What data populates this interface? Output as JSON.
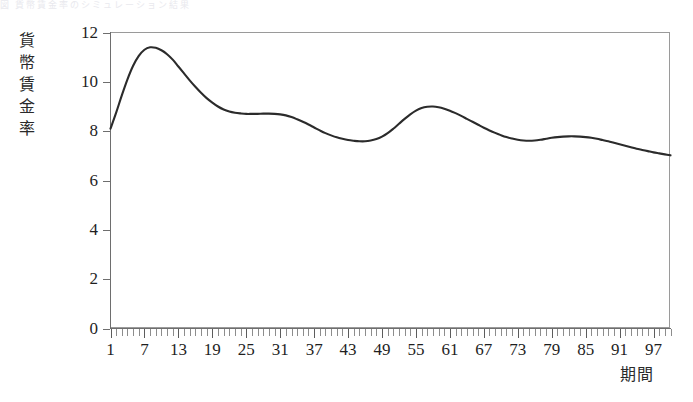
{
  "figure": {
    "top_caption_faint": "図 貨幣賃金率のシミュレーション結果"
  },
  "chart_data": {
    "type": "line",
    "title": "",
    "xlabel": "期間",
    "ylabel": "貨幣賃金率",
    "xlim": [
      1,
      100
    ],
    "ylim": [
      0,
      12
    ],
    "grid": false,
    "legend": "none",
    "y_ticks": [
      0,
      2,
      4,
      6,
      8,
      10,
      12
    ],
    "y_tick_labels": [
      "0",
      "2",
      "4",
      "6",
      "8",
      "10",
      "12"
    ],
    "x_ticks": [
      1,
      7,
      13,
      19,
      25,
      31,
      37,
      43,
      49,
      55,
      61,
      67,
      73,
      79,
      85,
      91,
      97
    ],
    "x_tick_labels": [
      "1",
      "7",
      "13",
      "19",
      "25",
      "31",
      "37",
      "43",
      "49",
      "55",
      "61",
      "67",
      "73",
      "79",
      "85",
      "91",
      "97"
    ],
    "x_minor_tick_step": 1,
    "series": [
      {
        "name": "貨幣賃金率",
        "color": "#2b2b2b",
        "x": [
          1,
          2,
          3,
          4,
          5,
          6,
          7,
          8,
          9,
          10,
          11,
          12,
          13,
          14,
          15,
          16,
          17,
          18,
          19,
          20,
          21,
          22,
          23,
          24,
          25,
          26,
          27,
          28,
          29,
          30,
          31,
          32,
          33,
          34,
          35,
          36,
          37,
          38,
          39,
          40,
          41,
          42,
          43,
          44,
          45,
          46,
          47,
          48,
          49,
          50,
          51,
          52,
          53,
          54,
          55,
          56,
          57,
          58,
          59,
          60,
          61,
          62,
          63,
          64,
          65,
          66,
          67,
          68,
          69,
          70,
          71,
          72,
          73,
          74,
          75,
          76,
          77,
          78,
          79,
          80,
          81,
          82,
          83,
          84,
          85,
          86,
          87,
          88,
          89,
          90,
          91,
          92,
          93,
          94,
          95,
          96,
          97,
          98,
          99,
          100
        ],
        "y": [
          8.1,
          8.75,
          9.45,
          10.1,
          10.65,
          11.05,
          11.3,
          11.4,
          11.38,
          11.28,
          11.12,
          10.9,
          10.62,
          10.34,
          10.06,
          9.8,
          9.56,
          9.34,
          9.16,
          9.0,
          8.88,
          8.8,
          8.75,
          8.72,
          8.7,
          8.7,
          8.7,
          8.71,
          8.71,
          8.7,
          8.68,
          8.64,
          8.57,
          8.48,
          8.38,
          8.27,
          8.15,
          8.03,
          7.92,
          7.83,
          7.75,
          7.69,
          7.64,
          7.61,
          7.59,
          7.59,
          7.62,
          7.68,
          7.78,
          7.92,
          8.1,
          8.3,
          8.5,
          8.68,
          8.83,
          8.94,
          8.99,
          9.0,
          8.97,
          8.91,
          8.83,
          8.73,
          8.62,
          8.5,
          8.38,
          8.26,
          8.14,
          8.03,
          7.93,
          7.84,
          7.76,
          7.7,
          7.65,
          7.62,
          7.61,
          7.62,
          7.65,
          7.69,
          7.73,
          7.76,
          7.78,
          7.79,
          7.79,
          7.78,
          7.76,
          7.73,
          7.69,
          7.64,
          7.59,
          7.53,
          7.47,
          7.41,
          7.35,
          7.29,
          7.24,
          7.19,
          7.14,
          7.1,
          7.06,
          7.02
        ]
      }
    ]
  }
}
